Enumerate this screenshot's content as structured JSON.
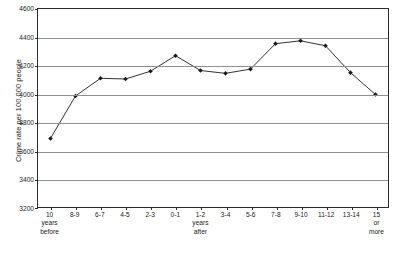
{
  "chart_data": {
    "type": "line",
    "title": "",
    "xlabel": "",
    "ylabel": "Crime rate per 100,000 people",
    "ylim": [
      3200,
      4600
    ],
    "ytick_step": 200,
    "yticks": [
      3200,
      3400,
      3600,
      3800,
      4000,
      4200,
      4400,
      4600
    ],
    "grid": true,
    "legend": false,
    "marker": "diamond",
    "line_color": "#1a1a1a",
    "marker_color": "#1a1a1a",
    "grid_color": "#8f8f8f",
    "axis_color": "#2b2b2b",
    "categories": [
      "10 years before",
      "8-9",
      "6-7",
      "4-5",
      "2-3",
      "0-1",
      "1-2 years after",
      "3-4",
      "5-6",
      "7-8",
      "9-10",
      "11-12",
      "13-14",
      "15 or more"
    ],
    "category_lines": [
      [
        "10",
        "years",
        "before"
      ],
      [
        "8-9"
      ],
      [
        "6-7"
      ],
      [
        "4-5"
      ],
      [
        "2-3"
      ],
      [
        "0-1"
      ],
      [
        "1-2",
        "years",
        "after"
      ],
      [
        "3-4"
      ],
      [
        "5-6"
      ],
      [
        "7-8"
      ],
      [
        "9-10"
      ],
      [
        "11-12"
      ],
      [
        "13-14"
      ],
      [
        "15",
        "or",
        "more"
      ]
    ],
    "values": [
      3685,
      3985,
      4110,
      4105,
      4160,
      4270,
      4165,
      4145,
      4175,
      4355,
      4375,
      4340,
      4150,
      3995
    ]
  }
}
